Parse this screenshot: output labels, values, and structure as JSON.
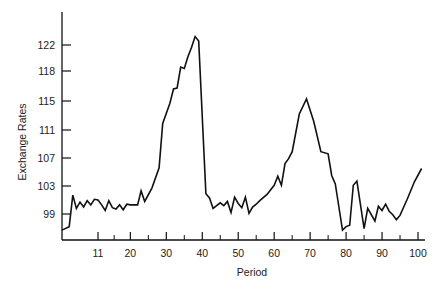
{
  "chart_data": {
    "type": "line",
    "title": "",
    "xlabel": "Period",
    "ylabel": "Exchange Rates",
    "x_ticks": [
      11,
      20,
      30,
      40,
      50,
      60,
      70,
      80,
      90,
      100
    ],
    "y_ticks": [
      99,
      103,
      107,
      111,
      115,
      118,
      122
    ],
    "xlim": [
      1,
      102
    ],
    "grid": false,
    "legend": "none",
    "series": [
      {
        "name": "Exchange Rates",
        "x": [
          1,
          3,
          4,
          5,
          6,
          7,
          8,
          9,
          10,
          11,
          12,
          13,
          14,
          15,
          16,
          17,
          18,
          19,
          20,
          22,
          23,
          24,
          26,
          28,
          29,
          31,
          32,
          33,
          34,
          35,
          36,
          37,
          38,
          39,
          41,
          42,
          43,
          45,
          46,
          47,
          48,
          49,
          50,
          51,
          52,
          53,
          54,
          55,
          56,
          58,
          60,
          61,
          62,
          63,
          64,
          65,
          67,
          69,
          71,
          73,
          75,
          76,
          77,
          78,
          79,
          80,
          81,
          82,
          83,
          85,
          86,
          88,
          89,
          90,
          91,
          92,
          93,
          94,
          95,
          97,
          99,
          101
        ],
        "values": [
          96.7,
          97.2,
          101.7,
          99.8,
          100.7,
          100.0,
          100.9,
          100.3,
          101.1,
          101.0,
          100.3,
          99.5,
          100.9,
          99.9,
          99.7,
          100.3,
          99.6,
          100.4,
          100.3,
          100.3,
          102.3,
          100.8,
          102.7,
          105.6,
          111.9,
          114.7,
          116.2,
          116.3,
          118.6,
          118.4,
          120.2,
          121.6,
          123.3,
          122.6,
          101.9,
          101.3,
          99.8,
          100.6,
          100.2,
          100.8,
          99.2,
          101.4,
          100.5,
          99.9,
          101.4,
          99.1,
          100.0,
          100.4,
          100.9,
          101.8,
          103.1,
          104.4,
          103.1,
          106.2,
          106.9,
          107.9,
          113.2,
          115.2,
          112.2,
          107.9,
          107.6,
          104.5,
          103.3,
          100.0,
          96.7,
          97.2,
          97.4,
          103.1,
          103.7,
          96.9,
          99.8,
          98.0,
          100.1,
          99.5,
          100.4,
          99.4,
          98.9,
          98.2,
          98.8,
          101.1,
          103.6,
          105.5
        ]
      }
    ]
  }
}
